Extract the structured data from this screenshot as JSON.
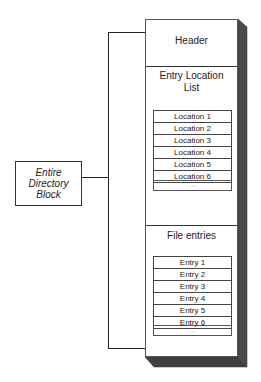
{
  "diagram": {
    "label_box": {
      "lines": [
        "Entire",
        "Directory",
        "Block"
      ]
    },
    "block": {
      "sections": [
        {
          "title_lines": [
            "Header"
          ]
        },
        {
          "title_lines": [
            "Entry Location",
            "List"
          ],
          "rows": [
            "Location 1",
            "Location 2",
            "Location 3",
            "Location 4",
            "Location 5",
            "Location 6"
          ],
          "ellipsis": "..."
        },
        {
          "title_lines": [
            "File entries"
          ],
          "rows": [
            "Entry 1",
            "Entry 2",
            "Entry 3",
            "Entry 4",
            "Entry 5",
            "Entry 6"
          ],
          "ellipsis": "..."
        }
      ]
    },
    "colors": {
      "line": "#222222",
      "shadow_side": "#4a4a4a",
      "shadow_bottom": "#3f3f3f",
      "background": "#ffffff"
    }
  }
}
